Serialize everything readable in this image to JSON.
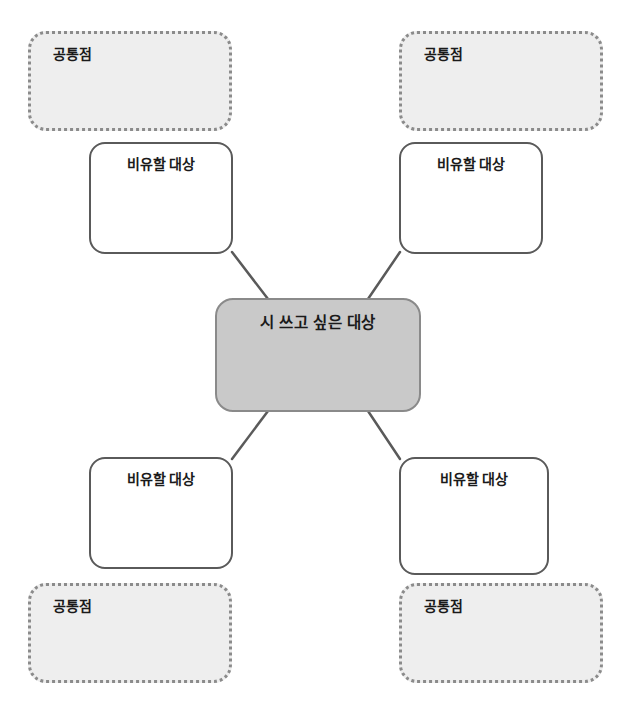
{
  "diagram": {
    "type": "mind-map",
    "center": {
      "label": "시 쓰고 싶은 대상",
      "fill_color": "#c9c9c9",
      "border_color": "#8a8a8a"
    },
    "branches": [
      {
        "id": "top-left",
        "metaphor_label": "비유할 대상",
        "common_label": "공통점"
      },
      {
        "id": "top-right",
        "metaphor_label": "비유할 대상",
        "common_label": "공통점"
      },
      {
        "id": "bottom-left",
        "metaphor_label": "비유할 대상",
        "common_label": "공통점"
      },
      {
        "id": "bottom-right",
        "metaphor_label": "비유할 대상",
        "common_label": "공통점"
      }
    ],
    "colors": {
      "common_fill": "#eeeeee",
      "common_border": "#8b8b8b",
      "metaphor_fill": "#ffffff",
      "metaphor_border": "#5a5a5a",
      "connector": "#5a5a5a",
      "text": "#1a1a1a",
      "background": "#ffffff"
    }
  }
}
